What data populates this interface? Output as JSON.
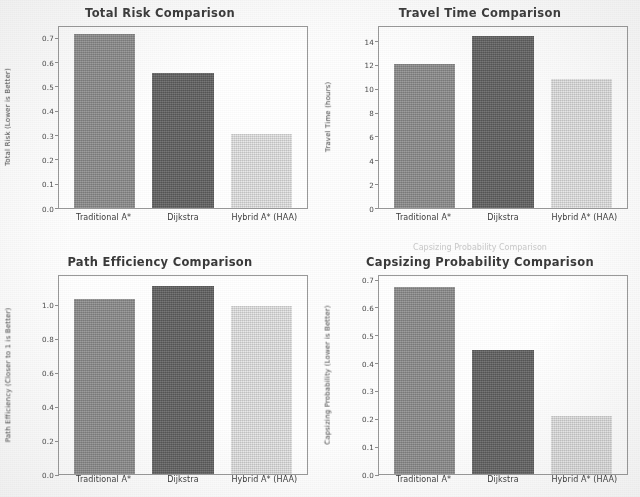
{
  "figure": {
    "categories": [
      "Traditional A*",
      "Dijkstra",
      "Hybrid A* (HAA)"
    ],
    "bar_colors": [
      "#8c8c8c",
      "#636363",
      "#dcdcdc"
    ],
    "ghost_overlap_text": "Capsizing Probability Comparison"
  },
  "chart_data": [
    {
      "type": "bar",
      "title": "Total Risk Comparison",
      "xlabel": "",
      "ylabel": "Total Risk (Lower is Better)",
      "categories": [
        "Traditional A*",
        "Dijkstra",
        "Hybrid A* (HAA)"
      ],
      "values": [
        0.72,
        0.56,
        0.305
      ],
      "ylim": [
        0.0,
        0.75
      ],
      "yticks": [
        0.0,
        0.1,
        0.2,
        0.3,
        0.4,
        0.5,
        0.6,
        0.7
      ],
      "ytick_labels": [
        "0.0",
        "0.1",
        "0.2",
        "0.3",
        "0.4",
        "0.5",
        "0.6",
        "0.7"
      ],
      "grid": false,
      "legend": "none"
    },
    {
      "type": "bar",
      "title": "Travel Time Comparison",
      "xlabel": "",
      "ylabel": "Travel Time (hours)",
      "categories": [
        "Traditional A*",
        "Dijkstra",
        "Hybrid A* (HAA)"
      ],
      "values": [
        12.2,
        14.5,
        10.9
      ],
      "ylim": [
        0,
        15.3
      ],
      "yticks": [
        0,
        2,
        4,
        6,
        8,
        10,
        12,
        14
      ],
      "ytick_labels": [
        "0",
        "2",
        "4",
        "6",
        "8",
        "10",
        "12",
        "14"
      ],
      "grid": false,
      "legend": "none"
    },
    {
      "type": "bar",
      "title": "Path Efficiency Comparison",
      "xlabel": "",
      "ylabel": "Path Efficiency (Closer to 1 is Better)",
      "categories": [
        "Traditional A*",
        "Dijkstra",
        "Hybrid A* (HAA)"
      ],
      "values": [
        1.04,
        1.12,
        1.0
      ],
      "ylim": [
        0.0,
        1.18
      ],
      "yticks": [
        0.0,
        0.2,
        0.4,
        0.6,
        0.8,
        1.0
      ],
      "ytick_labels": [
        "0.0",
        "0.2",
        "0.4",
        "0.6",
        "0.8",
        "1.0"
      ],
      "grid": false,
      "legend": "none"
    },
    {
      "type": "bar",
      "title": "Capsizing Probability Comparison",
      "xlabel": "",
      "ylabel": "Capsizing Probability (Lower is Better)",
      "categories": [
        "Traditional A*",
        "Dijkstra",
        "Hybrid A* (HAA)"
      ],
      "values": [
        0.68,
        0.45,
        0.21
      ],
      "ylim": [
        0.0,
        0.72
      ],
      "yticks": [
        0.0,
        0.1,
        0.2,
        0.3,
        0.4,
        0.5,
        0.6,
        0.7
      ],
      "ytick_labels": [
        "0.0",
        "0.1",
        "0.2",
        "0.3",
        "0.4",
        "0.5",
        "0.6",
        "0.7"
      ],
      "grid": false,
      "legend": "none"
    }
  ]
}
